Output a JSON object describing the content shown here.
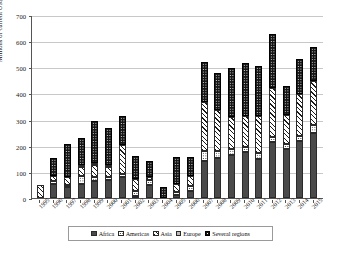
{
  "chart_data": {
    "type": "bar",
    "subtype": "stacked-bar",
    "title": "",
    "xlabel": "",
    "ylabel": "Millions of current US$",
    "ylim": [
      0,
      700
    ],
    "ytick_step": 100,
    "yticks": [
      0,
      100,
      200,
      300,
      400,
      500,
      600,
      700
    ],
    "grid": true,
    "legend_position": "bottom",
    "categories": [
      "1995",
      "1996",
      "1997",
      "1998",
      "1999",
      "2000",
      "2001",
      "2002",
      "2003",
      "2004",
      "2005",
      "2006",
      "2007",
      "2008",
      "2009",
      "2010",
      "2011",
      "2012",
      "2013",
      "2014",
      "2015"
    ],
    "series": [
      {
        "name": "Africa",
        "pattern": "solid-dark-gray",
        "color": "#4a4a4a",
        "values": [
          0,
          52,
          42,
          54,
          66,
          68,
          81,
          8,
          48,
          0,
          11,
          26,
          140,
          152,
          166,
          175,
          150,
          213,
          188,
          217,
          250
        ]
      },
      {
        "name": "Americas",
        "pattern": "white-dotted",
        "color": "#ffffff",
        "values": [
          0,
          12,
          8,
          32,
          16,
          12,
          12,
          20,
          20,
          0,
          12,
          20,
          38,
          26,
          20,
          20,
          24,
          20,
          20,
          20,
          28
        ]
      },
      {
        "name": "Asia",
        "pattern": "diagonal-hatch",
        "color": "#ffffff",
        "values": [
          48,
          20,
          30,
          32,
          46,
          38,
          110,
          46,
          12,
          0,
          30,
          38,
          190,
          160,
          124,
          118,
          140,
          188,
          108,
          160,
          170
        ]
      },
      {
        "name": "Europe",
        "pattern": "solid-light-gray",
        "color": "#bdbdbd",
        "values": [
          0,
          0,
          0,
          8,
          6,
          6,
          0,
          0,
          0,
          0,
          0,
          0,
          0,
          0,
          0,
          0,
          0,
          0,
          0,
          0,
          0
        ]
      },
      {
        "name": "Several regions",
        "pattern": "black-white-dotted",
        "color": "#161616",
        "values": [
          0,
          70,
          127,
          104,
          159,
          141,
          110,
          86,
          63,
          44,
          103,
          73,
          152,
          140,
          188,
          205,
          192,
          207,
          114,
          134,
          130
        ]
      }
    ],
    "totals": [
      48,
      154,
      207,
      230,
      293,
      265,
      313,
      160,
      143,
      44,
      156,
      157,
      520,
      478,
      498,
      518,
      506,
      628,
      430,
      531,
      578
    ]
  },
  "legend": {
    "items": [
      {
        "label": "Africa",
        "swatch": "swatch-africa"
      },
      {
        "label": "Americas",
        "swatch": "swatch-americas"
      },
      {
        "label": "Asia",
        "swatch": "swatch-asia"
      },
      {
        "label": "Europe",
        "swatch": "swatch-europe"
      },
      {
        "label": "Several regions",
        "swatch": "swatch-several"
      }
    ]
  }
}
